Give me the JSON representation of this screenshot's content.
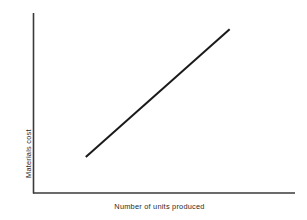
{
  "figure": {
    "background_color": "#ffffff",
    "line_color": "#1a1a1a",
    "axis_color": "#3a3a3a"
  },
  "chart_data": {
    "type": "line",
    "title": "",
    "subtitle": "",
    "xlabel": "Number of units produced",
    "ylabel": "Materials cost",
    "grid": false,
    "legend": null,
    "xlim": [
      0,
      100
    ],
    "ylim": [
      0,
      100
    ],
    "xticks": [],
    "yticks": [],
    "xticklabels": [],
    "yticklabels": [],
    "annotations": [],
    "series": [
      {
        "name": "Materials cost",
        "color": "#1a1a1a",
        "linewidth": 2,
        "x": [
          20,
          75
        ],
        "y": [
          20,
          91
        ],
        "points": [
          {
            "x": 20,
            "y": 20
          },
          {
            "x": 75,
            "y": 91
          }
        ]
      }
    ]
  }
}
